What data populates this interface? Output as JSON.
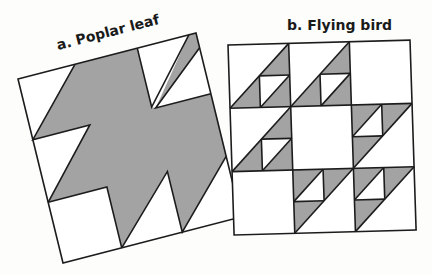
{
  "figure": {
    "colors": {
      "background": "#fdfdfc",
      "fill_gray": "#a3a3a3",
      "line": "#1c1c1c",
      "white": "#ffffff"
    },
    "panels": [
      {
        "id": "a",
        "label": "a. Poplar leaf",
        "description": "Rotated square block with a gray poplar-leaf shape on white background"
      },
      {
        "id": "b",
        "label": "b. Flying bird",
        "description": "3x3 grid block; six cells contain flying-bird half-square-triangle units",
        "grid": {
          "rows": 3,
          "cols": 3,
          "bird_cells": [
            {
              "row": 1,
              "col": 1,
              "orientation": "up-right"
            },
            {
              "row": 1,
              "col": 2,
              "orientation": "up-right"
            },
            {
              "row": 2,
              "col": 1,
              "orientation": "up-right"
            },
            {
              "row": 2,
              "col": 3,
              "orientation": "down-left"
            },
            {
              "row": 3,
              "col": 2,
              "orientation": "down-left"
            },
            {
              "row": 3,
              "col": 3,
              "orientation": "down-left"
            }
          ]
        }
      }
    ]
  }
}
